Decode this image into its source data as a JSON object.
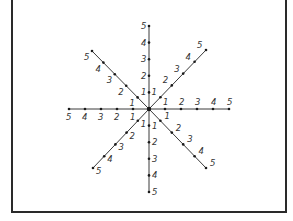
{
  "diagram": {
    "type": "eight-ray number star",
    "center": {
      "x": 149,
      "y": 109
    },
    "colors": {
      "line": "#3a3a3a",
      "dot": "#1a1a1a",
      "label": "#333333",
      "border": "#2a2a2a"
    },
    "rays": [
      {
        "name": "east",
        "dx": 16,
        "dy": 0,
        "labels": [
          "1",
          "2",
          "3",
          "4",
          "5"
        ],
        "label_offset": {
          "x": -2,
          "y": -4
        }
      },
      {
        "name": "west",
        "dx": -16,
        "dy": 0,
        "labels": [
          "1",
          "2",
          "3",
          "4",
          "5"
        ],
        "label_offset": {
          "x": -3,
          "y": 11
        }
      },
      {
        "name": "north",
        "dx": 0,
        "dy": -16.6,
        "labels": [
          "1",
          "2",
          "3",
          "4",
          "5"
        ],
        "label_offset": {
          "x": -8,
          "y": 3
        }
      },
      {
        "name": "south",
        "dx": 0,
        "dy": 16.6,
        "labels": [
          "1",
          "2",
          "3",
          "4",
          "5"
        ],
        "label_offset": {
          "x": 3,
          "y": 3
        }
      },
      {
        "name": "north-east",
        "dx": 11.4,
        "dy": -11.8,
        "labels": [
          "1",
          "2",
          "3",
          "4",
          "5"
        ],
        "label_offset": {
          "x": -9,
          "y": -2
        }
      },
      {
        "name": "north-west",
        "dx": -11.4,
        "dy": -11.6,
        "labels": [
          "1",
          "2",
          "3",
          "4",
          "5"
        ],
        "label_offset": {
          "x": -8,
          "y": 9
        }
      },
      {
        "name": "south-west",
        "dx": -11.2,
        "dy": 11.8,
        "labels": [
          "1",
          "2",
          "3",
          "4",
          "5"
        ],
        "label_offset": {
          "x": 3,
          "y": 6
        }
      },
      {
        "name": "south-east",
        "dx": 11.4,
        "dy": 11.8,
        "labels": [
          "1",
          "2",
          "3",
          "4",
          "5"
        ],
        "label_offset": {
          "x": 4,
          "y": -2
        }
      }
    ]
  }
}
